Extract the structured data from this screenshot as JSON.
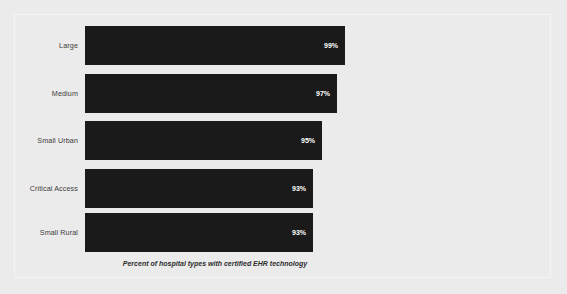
{
  "chart_data": {
    "type": "bar",
    "orientation": "horizontal",
    "title": "",
    "caption": "Percent of hospital types with certified EHR technology",
    "xlabel": "",
    "ylabel": "",
    "categories": [
      "Large",
      "Medium",
      "Small Urban",
      "Critical Access",
      "Small Rural"
    ],
    "values": [
      99,
      97,
      95,
      93,
      93
    ],
    "value_labels": [
      "99%",
      "97%",
      "95%",
      "93%",
      "93%"
    ],
    "unit": "%",
    "xlim": [
      0,
      100
    ],
    "grid": false,
    "legend": false,
    "bar_color": "#1a1a1a",
    "value_label_color": "#ffffff",
    "category_label_color": "#3c3c3c",
    "background_color": "#ebebeb",
    "bars": [
      {
        "category": "Large",
        "value": 99,
        "label": "99%",
        "pixel_width": 260
      },
      {
        "category": "Medium",
        "value": 97,
        "label": "97%",
        "pixel_width": 252
      },
      {
        "category": "Small Urban",
        "value": 95,
        "label": "95%",
        "pixel_width": 237
      },
      {
        "category": "Critical Access",
        "value": 93,
        "label": "93%",
        "pixel_width": 228
      },
      {
        "category": "Small Rural",
        "value": 93,
        "label": "93%",
        "pixel_width": 228
      }
    ]
  }
}
